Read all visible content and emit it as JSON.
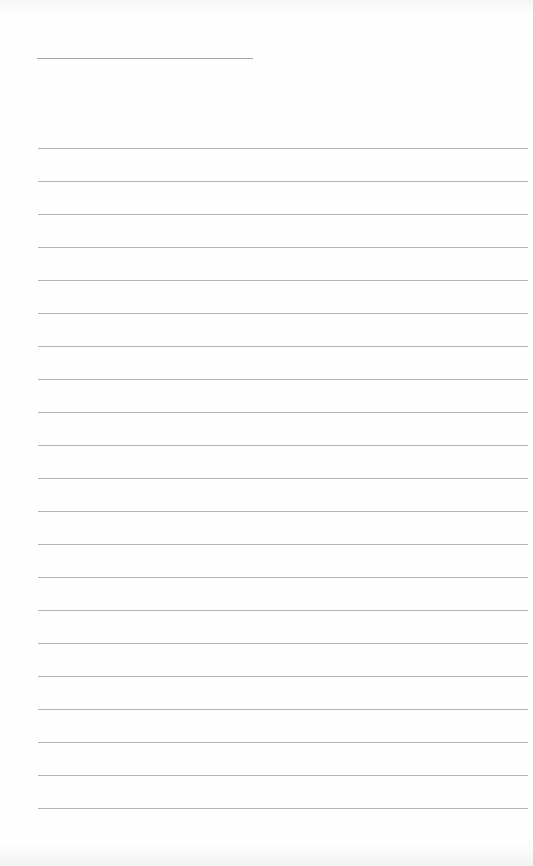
{
  "document": {
    "type": "blank lined page",
    "header_rule": {
      "x1": 37,
      "x2": 253,
      "y": 58,
      "color": "#a8a8a8"
    },
    "body_rules": {
      "count": 21,
      "x1": 38,
      "x2": 528,
      "first_y": 148,
      "spacing": 33,
      "color": "#b4b4b4"
    }
  }
}
